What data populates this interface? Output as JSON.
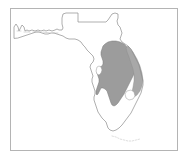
{
  "figure": {
    "kind": "thematic-distribution-map",
    "region_name": "Florida",
    "background_color": "#ffffff",
    "frame_color": "#b4b4b4",
    "coastline_color": "#8c8c8c",
    "state_border_color": "#8c8c8c",
    "shaded_range_color": "#9c9c9c",
    "shaded_range_stroke": "#7a7a7a",
    "lake_fill_color": "#ffffff",
    "keys_color": "#c8c8c8",
    "width": 189,
    "height": 159
  },
  "frame": {
    "x": 10,
    "y": 8,
    "width": 167,
    "height": 142,
    "stroke_width": 1
  },
  "layers": [
    {
      "id": "state-outline",
      "label": "Florida state outline",
      "filled": false
    },
    {
      "id": "shaded-range",
      "label": "Shaded distribution range",
      "filled": true,
      "fill": "#9c9c9c"
    },
    {
      "id": "lake-okeechobee",
      "label": "Lake Okeechobee",
      "filled": true,
      "fill": "#ffffff"
    },
    {
      "id": "florida-keys",
      "label": "Florida Keys",
      "filled": false
    }
  ],
  "geometry": {
    "state_outline_path": "M 14 38 L 14 27 L 16 24 L 18 27 L 19 31 L 21 27 L 22 25 L 24 27 L 25 31 L 27 30 L 29 31 L 32 30 L 35 31 L 38 30 L 41 31 L 44 30 L 46 31 L 49 30 L 52 31 L 55 30 L 57 29 L 59 30 L 62 30 L 63 28 L 62 24 L 62 18 L 63 14 L 66 13 L 70 13 L 74 13 L 78 13 L 78 17 L 78 22 L 82 22 L 88 22 L 94 22 L 100 22 L 106 22 L 108 20 L 110 17 L 112 14 L 115 13 L 118 14 L 118 18 L 117 21 L 118 25 L 120 27 L 121 30 L 122 33 L 121 36 L 120 39 L 122 42 L 125 44 L 128 46 L 131 49 L 133 53 L 135 57 L 137 61 L 139 65 L 140 69 L 141 73 L 142 77 L 143 81 L 143 85 L 142 89 L 141 93 L 139 97 L 137 101 L 135 105 L 133 109 L 131 113 L 128 117 L 125 121 L 122 125 L 119 128 L 116 130 L 113 131 L 110 130 L 108 128 L 107 125 L 106 122 L 104 120 L 102 118 L 100 115 L 98 112 L 97 109 L 96 106 L 95 103 L 94 100 L 94 97 L 95 94 L 95 91 L 94 88 L 93 85 L 92 82 L 92 79 L 93 76 L 92 73 L 91 70 L 90 67 L 91 64 L 93 62 L 94 59 L 93 56 L 91 54 L 89 52 L 87 50 L 85 47 L 83 45 L 81 42 L 78 40 L 75 39 L 72 39 L 69 39 L 66 38 L 63 36 L 60 35 L 57 34 L 54 33 L 51 33 L 48 34 L 45 34 L 42 33 L 39 32 L 36 32 L 33 33 L 30 34 L 27 35 L 24 36 L 21 37 L 18 38 Z",
    "shaded_range_path": "M 105 44 L 108 42 L 112 41 L 116 41 L 120 42 L 124 44 L 127 47 L 130 50 L 132 54 L 134 58 L 135 62 L 136 66 L 135 70 L 134 74 L 132 78 L 130 82 L 128 86 L 126 90 L 124 94 L 122 97 L 120 100 L 118 103 L 116 105 L 114 106 L 112 105 L 111 103 L 110 100 L 109 97 L 108 94 L 107 91 L 105 89 L 103 88 L 101 88 L 100 90 L 99 92 L 98 94 L 97 95 L 96 94 L 96 91 L 97 88 L 98 85 L 99 82 L 99 79 L 98 76 L 97 73 L 97 70 L 98 68 L 100 67 L 102 66 L 103 64 L 103 61 L 102 58 L 101 55 L 101 52 L 102 49 L 103 46 Z",
    "atlantic_strip_path": "M 128 46 L 133 52 L 137 59 L 140 66 L 142 73 L 143 80 L 142 86 L 140 91 L 137 95 L 134 97 L 132 96 L 132 92 L 133 87 L 134 81 L 134 75 L 133 69 L 131 63 L 129 57 L 127 52 L 126 48 Z",
    "tampa_bay_notch_path": "M 97 67 L 99 66 L 101 67 L 102 70 L 101 73 L 99 75 L 97 74 L 96 71 Z",
    "lake_okeechobee_path": "M 127 91 L 131 90 L 134 92 L 135 96 L 133 99 L 129 100 L 126 98 L 125 94 Z",
    "keys_path": "M 112 136 L 116 137 L 120 139 L 124 140 L 128 141 L 132 141 L 136 140 L 140 139",
    "panhandle_islands_path": "M 17 31 L 21 31 M 24 32 L 30 32 M 33 32 L 40 32 M 43 32 L 50 33 M 53 33 L 58 33"
  },
  "annotations": {
    "title": "",
    "caption": "",
    "legend_entries": []
  }
}
